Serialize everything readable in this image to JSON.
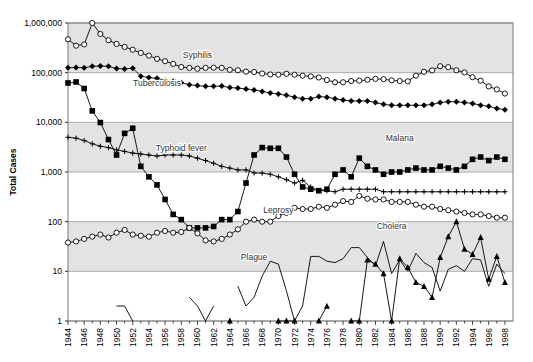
{
  "chart_data": {
    "type": "line",
    "title": "",
    "xlabel": "",
    "ylabel": "Total Cases",
    "yscale": "log",
    "ylim": [
      1,
      1000000
    ],
    "ytick_labels": [
      "1",
      "10",
      "100",
      "1,000",
      "10,000",
      "100,000",
      "1,000,000"
    ],
    "ytick_values": [
      1,
      10,
      100,
      1000,
      10000,
      100000,
      1000000
    ],
    "xlim": [
      1944,
      1999
    ],
    "xtick_labels": [
      "1944",
      "1946",
      "1948",
      "1950",
      "1952",
      "1954",
      "1956",
      "1958",
      "1960",
      "1962",
      "1964",
      "1966",
      "1968",
      "1970",
      "1972",
      "1974",
      "1976",
      "1978",
      "1980",
      "1982",
      "1984",
      "1986",
      "1988",
      "1990",
      "1992",
      "1994",
      "1996",
      "1998"
    ],
    "grid": true,
    "legend": "inline-annotations",
    "x": [
      1944,
      1945,
      1946,
      1947,
      1948,
      1949,
      1950,
      1951,
      1952,
      1953,
      1954,
      1955,
      1956,
      1957,
      1958,
      1959,
      1960,
      1961,
      1962,
      1963,
      1964,
      1965,
      1966,
      1967,
      1968,
      1969,
      1970,
      1971,
      1972,
      1973,
      1974,
      1975,
      1976,
      1977,
      1978,
      1979,
      1980,
      1981,
      1982,
      1983,
      1984,
      1985,
      1986,
      1987,
      1988,
      1989,
      1990,
      1991,
      1992,
      1993,
      1994,
      1995,
      1996,
      1997,
      1998
    ],
    "series": [
      {
        "name": "Syphilis",
        "marker": "open-circle",
        "label_x": 1960,
        "label_y": 200000,
        "values": [
          470000,
          350000,
          370000,
          1000000,
          600000,
          450000,
          380000,
          330000,
          290000,
          250000,
          220000,
          190000,
          170000,
          150000,
          130000,
          125000,
          120000,
          125000,
          126000,
          125000,
          114000,
          112000,
          105000,
          103000,
          96000,
          92000,
          91000,
          95000,
          91000,
          87000,
          84000,
          80000,
          71000,
          64000,
          64000,
          68000,
          69000,
          72000,
          75000,
          74000,
          70000,
          68000,
          67000,
          87000,
          104000,
          111000,
          135000,
          129000,
          112000,
          101000,
          81000,
          69000,
          53000,
          46000,
          38000
        ]
      },
      {
        "name": "Tuberculosis",
        "marker": "filled-diamond",
        "label_x": 1955,
        "label_y": 55000,
        "values": [
          126000,
          127000,
          126000,
          134000,
          136000,
          134000,
          121000,
          119000,
          123000,
          85000,
          80000,
          77000,
          70000,
          67000,
          63000,
          57000,
          55000,
          53000,
          53000,
          54000,
          50000,
          49000,
          47000,
          45000,
          42000,
          39000,
          37000,
          35000,
          32000,
          30000,
          30000,
          33000,
          32000,
          30000,
          28000,
          27000,
          27000,
          27000,
          25000,
          23000,
          22000,
          22000,
          22000,
          22000,
          22000,
          23000,
          25000,
          26000,
          26000,
          25000,
          24000,
          22000,
          21000,
          19000,
          18000
        ]
      },
      {
        "name": "Typhoid fever",
        "marker": "plus",
        "label_x": 1958,
        "label_y": 2600,
        "values": [
          5000,
          4800,
          4300,
          3700,
          3300,
          3100,
          2800,
          2600,
          2400,
          2300,
          2200,
          2100,
          2200,
          2200,
          2200,
          2100,
          1900,
          1700,
          1500,
          1300,
          1200,
          1100,
          1100,
          960,
          950,
          900,
          800,
          700,
          600,
          680,
          500,
          420,
          420,
          400,
          450,
          450,
          450,
          450,
          450,
          400,
          400,
          400,
          400,
          400,
          400,
          400,
          400,
          400,
          400,
          400,
          400,
          400,
          400,
          400,
          400
        ]
      },
      {
        "name": "Malaria",
        "marker": "filled-square",
        "label_x": 1985,
        "label_y": 4200,
        "values": [
          62000,
          65000,
          48000,
          17000,
          9900,
          4500,
          2200,
          6000,
          7600,
          1300,
          800,
          550,
          280,
          140,
          110,
          75,
          75,
          75,
          80,
          110,
          110,
          160,
          600,
          2200,
          3100,
          3000,
          3000,
          2000,
          900,
          500,
          450,
          420,
          450,
          900,
          1100,
          800,
          1900,
          1300,
          1100,
          900,
          1000,
          1000,
          1100,
          1200,
          1100,
          1100,
          1300,
          1200,
          1100,
          1300,
          1800,
          2000,
          1700,
          2000,
          1800
        ]
      },
      {
        "name": "Leprosy",
        "marker": "open-circle",
        "label_x": 1970,
        "label_y": 150,
        "values": [
          38,
          40,
          45,
          50,
          55,
          48,
          60,
          68,
          55,
          52,
          50,
          60,
          65,
          60,
          62,
          75,
          58,
          42,
          40,
          45,
          55,
          70,
          100,
          110,
          100,
          100,
          130,
          150,
          190,
          180,
          180,
          200,
          190,
          220,
          260,
          250,
          330,
          290,
          280,
          280,
          250,
          250,
          250,
          220,
          200,
          200,
          180,
          170,
          160,
          150,
          140,
          140,
          130,
          120,
          120
        ]
      },
      {
        "name": "Cholera",
        "marker": "filled-triangle",
        "label_x": 1984,
        "label_y": 70,
        "values": [
          null,
          null,
          null,
          null,
          null,
          null,
          null,
          null,
          null,
          null,
          null,
          null,
          null,
          null,
          null,
          null,
          null,
          null,
          null,
          null,
          1,
          null,
          null,
          null,
          null,
          null,
          1,
          1,
          1,
          null,
          null,
          1,
          2,
          null,
          null,
          1,
          1,
          17,
          14,
          9,
          1,
          18,
          12,
          6,
          5,
          3,
          19,
          50,
          100,
          28,
          22,
          48,
          7,
          20,
          6
        ]
      },
      {
        "name": "Plague",
        "marker": "line-only",
        "label_x": 1967,
        "label_y": 17,
        "values": [
          null,
          null,
          null,
          null,
          null,
          null,
          2,
          2,
          1,
          null,
          null,
          null,
          null,
          null,
          null,
          3,
          2,
          1,
          2,
          null,
          null,
          5,
          2,
          3,
          8,
          16,
          14,
          4,
          1,
          2,
          20,
          20,
          16,
          15,
          18,
          30,
          30,
          19,
          13,
          40,
          9,
          17,
          10,
          23,
          15,
          12,
          4,
          11,
          13,
          10,
          18,
          17,
          5,
          14,
          9
        ]
      }
    ]
  },
  "axes": {
    "y_title": "Total Cases"
  }
}
